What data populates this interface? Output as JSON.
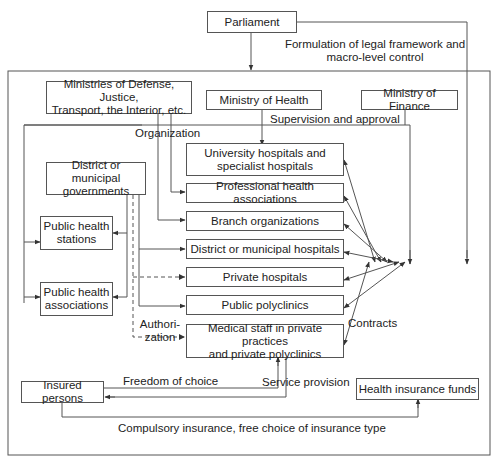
{
  "nodes": {
    "parliament": "Parliament",
    "other_ministries": "Ministries of Defense, Justice,\nTransport, the Interior, etc.",
    "ministry_health": "Ministry of Health",
    "ministry_finance": "Ministry of Finance",
    "district_gov": "District or municipal\ngovernments",
    "public_health_stations": "Public health\nstations",
    "public_health_associations": "Public health\nassociations",
    "university_hospitals": "University hospitals and\nspecialist hospitals",
    "professional_associations": "Professional health associations",
    "branch_orgs": "Branch organizations",
    "district_hospitals": "District or municipal hospitals",
    "private_hospitals": "Private hospitals",
    "public_polyclinics": "Public polyclinics",
    "medical_staff": "Medical staff in private practices\nand private polyclinics",
    "insured_persons": "Insured persons",
    "health_insurance_funds": "Health insurance funds"
  },
  "labels": {
    "legal_framework": "Formulation of legal framework and\nmacro-level control",
    "supervision": "Supervision and approval",
    "organization": "Organization",
    "authorization": "Authori-\nzation",
    "contracts": "Contracts",
    "freedom_of_choice": "Freedom of choice",
    "service_provision": "Service provision",
    "compulsory_insurance": "Compulsory insurance, free choice of insurance type"
  },
  "colors": {
    "line": "#555555",
    "text": "#222222",
    "background": "#ffffff"
  }
}
